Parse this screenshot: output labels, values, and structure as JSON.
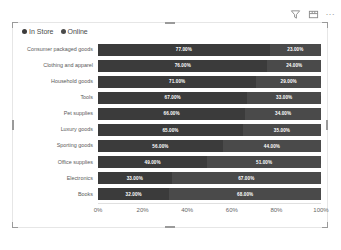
{
  "header": {
    "icons": [
      {
        "name": "filter-icon",
        "glyph": "funnel"
      },
      {
        "name": "focus-mode-icon",
        "glyph": "focus"
      },
      {
        "name": "more-options-icon",
        "glyph": "..."
      }
    ]
  },
  "legend": [
    {
      "label": "In Store",
      "color": "#3b3b3b"
    },
    {
      "label": "Online",
      "color": "#4a4a4a"
    }
  ],
  "chart_data": {
    "type": "bar",
    "title": "",
    "subtype": "100% stacked horizontal bar",
    "orientation": "horizontal",
    "stacked": true,
    "xlabel": "",
    "ylabel": "",
    "xlim": [
      0,
      100
    ],
    "grid": false,
    "legend_position": "top-left",
    "xticks": [
      "0%",
      "20%",
      "40%",
      "60%",
      "80%",
      "100%"
    ],
    "xtick_values": [
      0,
      20,
      40,
      60,
      80,
      100
    ],
    "categories": [
      "Consumer packaged goods",
      "Clothing and apparel",
      "Household goods",
      "Tools",
      "Pet supplies",
      "Luxury goods",
      "Sporting goods",
      "Office supplies",
      "Electronics",
      "Books"
    ],
    "series": [
      {
        "name": "In Store",
        "color": "#3b3b3b",
        "values": [
          77,
          76,
          71,
          67,
          66,
          65,
          56,
          49,
          33,
          32
        ],
        "labels": [
          "77.00%",
          "76.00%",
          "71.00%",
          "67.00%",
          "66.00%",
          "65.00%",
          "56.00%",
          "49.00%",
          "33.00%",
          "32.00%"
        ]
      },
      {
        "name": "Online",
        "color": "#4a4a4a",
        "values": [
          23,
          24,
          29,
          33,
          34,
          35,
          44,
          51,
          67,
          68
        ],
        "labels": [
          "23.00%",
          "24.00%",
          "29.00%",
          "33.00%",
          "34.00%",
          "35.00%",
          "44.00%",
          "51.00%",
          "67.00%",
          "68.00%"
        ]
      }
    ]
  }
}
